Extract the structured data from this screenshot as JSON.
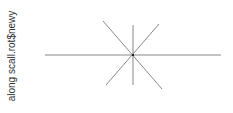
{
  "chart_data": {
    "type": "line",
    "title": "",
    "xlabel": "",
    "ylabel": "along scall.rot$newy",
    "grid": false,
    "axes_visible": false,
    "legend": null,
    "line_color": "#888888",
    "center_color": "#222222",
    "center": {
      "x": 133,
      "y": 55
    },
    "segments": [
      {
        "name": "horizontal",
        "x1": 45,
        "y1": 55,
        "x2": 221,
        "y2": 55
      },
      {
        "name": "vertical",
        "x1": 133,
        "y1": 25,
        "x2": 133,
        "y2": 85
      },
      {
        "name": "diagonal-nw-se",
        "x1": 103,
        "y1": 21,
        "x2": 162,
        "y2": 89
      },
      {
        "name": "diagonal-ne-sw",
        "x1": 159,
        "y1": 24,
        "x2": 106,
        "y2": 85
      }
    ]
  }
}
